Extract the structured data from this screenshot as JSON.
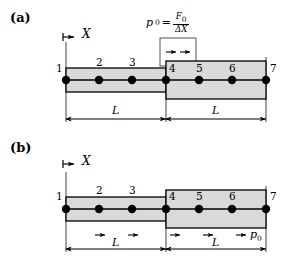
{
  "figure": {
    "panels": [
      {
        "id": "a",
        "label": "(a)",
        "axis_label": "X",
        "formula": {
          "lhs": "p",
          "lhs_sub": "0",
          "equals": "=",
          "numerator": "F",
          "numerator_sub": "0",
          "denominator": "ΔX"
        },
        "nodes": [
          "1",
          "2",
          "3",
          "4",
          "5",
          "6",
          "7"
        ],
        "dimensions": [
          "L",
          "L"
        ],
        "load_box_arrows": 2
      },
      {
        "id": "b",
        "label": "(b)",
        "axis_label": "X",
        "nodes": [
          "1",
          "2",
          "3",
          "4",
          "5",
          "6",
          "7"
        ],
        "dimensions": [
          "L",
          "L"
        ],
        "load_label": "p",
        "load_label_sub": "0",
        "left_span_arrows": 2,
        "right_span_arrows": 3
      }
    ],
    "colors": {
      "beam_fill": "#d9d9d9",
      "beam_stroke": "#000000",
      "node_fill": "#000000",
      "dim_line": "#000000",
      "reference_line": "#555555",
      "background": "#ffffff"
    }
  }
}
